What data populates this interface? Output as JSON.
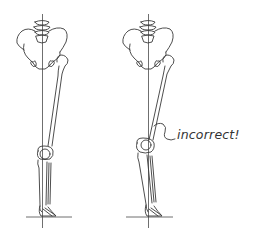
{
  "figure": {
    "panels": [
      {
        "id": "left",
        "label": "correct alignment",
        "annotation": ""
      },
      {
        "id": "right",
        "label": "misaligned",
        "annotation": "incorrect!"
      }
    ]
  },
  "annotation": {
    "text": "incorrect!",
    "color": "#333333"
  },
  "colors": {
    "line": "#3a3a3a",
    "background": "#ffffff"
  }
}
